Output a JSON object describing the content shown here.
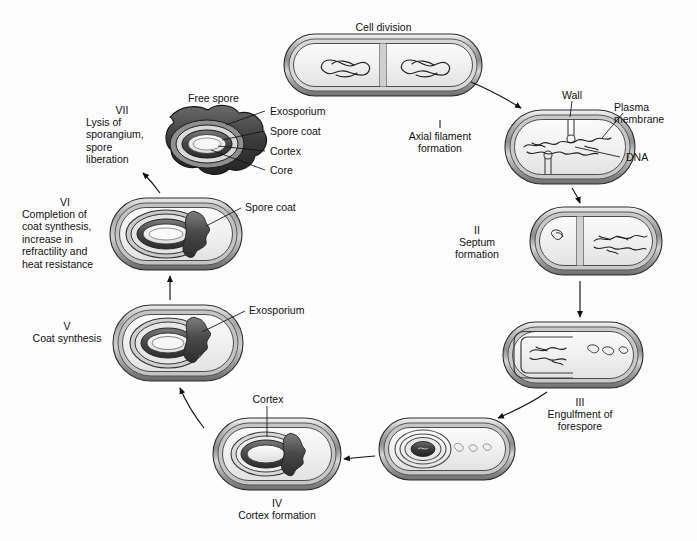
{
  "figure": {
    "background_color": "#fdfdfd",
    "line_color": "#1a1a1a"
  },
  "top": {
    "cell_division_label": "Cell division"
  },
  "stages": [
    {
      "id": "stage-1",
      "roman": "I",
      "name": "Axial filament\nformation"
    },
    {
      "id": "stage-2",
      "roman": "II",
      "name": "Septum\nformation"
    },
    {
      "id": "stage-3",
      "roman": "III",
      "name": "Engulfment of\nforespore"
    },
    {
      "id": "stage-4",
      "roman": "IV",
      "name": "Cortex formation"
    },
    {
      "id": "stage-5",
      "roman": "V",
      "name": "Coat synthesis"
    },
    {
      "id": "stage-6",
      "roman": "VI",
      "name": "Completion of\ncoat synthesis,\nincrease in\nrefractility and\nheat resistance"
    },
    {
      "id": "stage-7",
      "roman": "VII",
      "name": "Lysis of\nsporangium,\nspore\nliberation"
    }
  ],
  "callouts": {
    "wall": "Wall",
    "plasma_membrane": "Plasma\nmembrane",
    "dna": "DNA",
    "free_spore": "Free spore",
    "exosporium": "Exosporium",
    "spore_coat": "Spore coat",
    "cortex": "Cortex",
    "core": "Core",
    "exosporium_stage5": "Exosporium",
    "spore_coat_stage6": "Spore coat",
    "cortex_stage4": "Cortex"
  }
}
